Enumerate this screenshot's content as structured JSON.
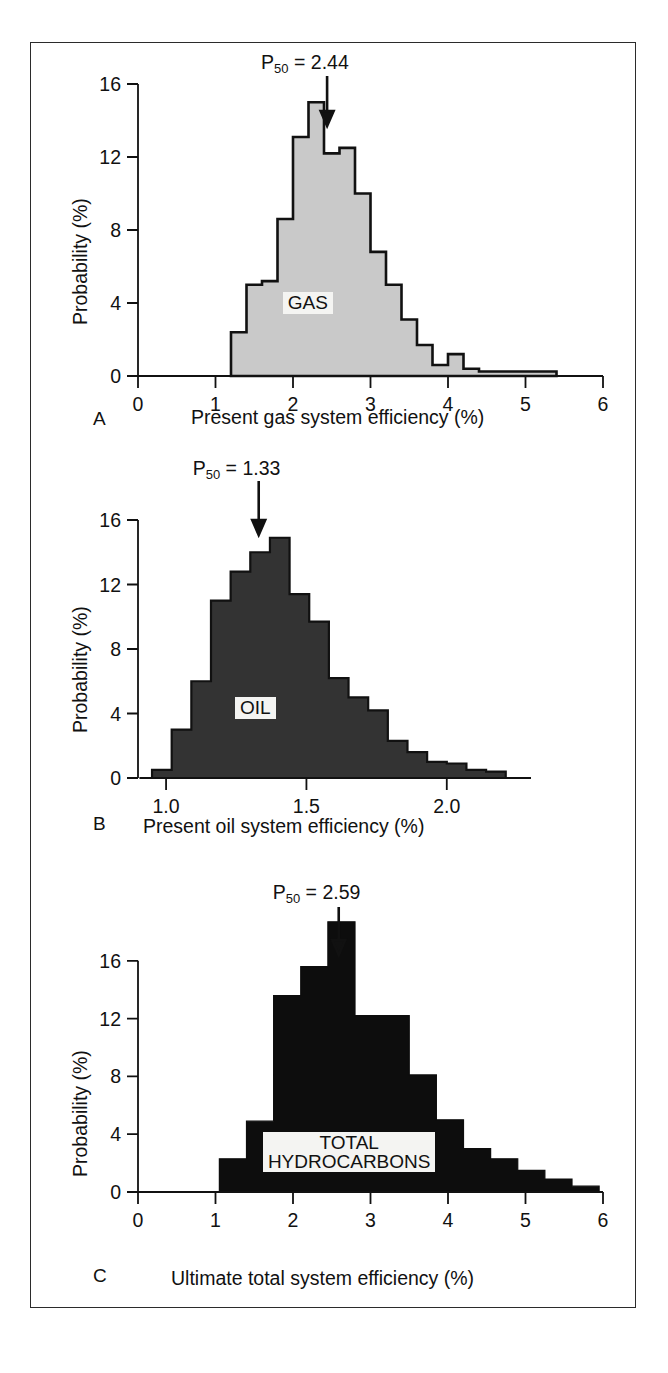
{
  "figure": {
    "background": "#ffffff",
    "frame_color": "#2b2b2b",
    "panels": [
      {
        "letter": "A",
        "tag": "GAS",
        "p50_prefix": "P",
        "p50_sub": "50",
        "p50_eq": " = 2.44",
        "xlabel": "Present gas system efficiency (%)",
        "ylabel": "Probability (%)"
      },
      {
        "letter": "B",
        "tag": "OIL",
        "p50_prefix": "P",
        "p50_sub": "50",
        "p50_eq": " = 1.33",
        "xlabel": "Present oil system efficiency (%)",
        "ylabel": "Probability (%)"
      },
      {
        "letter": "C",
        "tag_line1": "TOTAL",
        "tag_line2": "HYDROCARBONS",
        "p50_prefix": "P",
        "p50_sub": "50",
        "p50_eq": " = 2.59",
        "xlabel": "Ultimate total system efficiency (%)",
        "ylabel": "Probability (%)"
      }
    ]
  },
  "chart_data": [
    {
      "type": "bar",
      "panel": "A",
      "title": "GAS",
      "annotation": "P50 = 2.44",
      "p50": 2.44,
      "xlabel": "Present gas system efficiency (%)",
      "ylabel": "Probability (%)",
      "xlim": [
        0,
        6
      ],
      "ylim": [
        0,
        16
      ],
      "xticks": [
        0,
        1,
        2,
        3,
        4,
        5,
        6
      ],
      "xtick_labels": [
        "0",
        "1",
        "2",
        "3",
        "4",
        "5",
        "6"
      ],
      "yticks": [
        0,
        4,
        8,
        12,
        16
      ],
      "ytick_labels": [
        "0",
        "4",
        "8",
        "12",
        "16"
      ],
      "grid": false,
      "fill_color": "#c9c9c9",
      "edge_color": "#111111",
      "bin_width": 0.2,
      "bin_starts": [
        1.2,
        1.4,
        1.6,
        1.8,
        2.0,
        2.2,
        2.4,
        2.6,
        2.8,
        3.0,
        3.2,
        3.4,
        3.6,
        3.8,
        4.0,
        4.2,
        4.4,
        4.6,
        4.8,
        5.0,
        5.2
      ],
      "values": [
        2.4,
        5.0,
        5.2,
        8.6,
        13.1,
        15.0,
        12.2,
        12.5,
        10.0,
        6.8,
        5.0,
        3.1,
        1.7,
        0.6,
        1.2,
        0.4,
        0.25,
        0.25,
        0.25,
        0.25,
        0.25
      ]
    },
    {
      "type": "bar",
      "panel": "B",
      "title": "OIL",
      "annotation": "P50 = 1.33",
      "p50": 1.33,
      "xlabel": "Present oil system efficiency (%)",
      "ylabel": "Probability (%)",
      "xlim": [
        0.9,
        2.3
      ],
      "ylim": [
        0,
        16
      ],
      "xticks": [
        1.0,
        1.5,
        2.0
      ],
      "xtick_labels": [
        "1.0",
        "1.5",
        "2.0"
      ],
      "yticks": [
        0,
        4,
        8,
        12,
        16
      ],
      "ytick_labels": [
        "0",
        "4",
        "8",
        "12",
        "16"
      ],
      "grid": false,
      "fill_color": "#333333",
      "edge_color": "#111111",
      "bin_width": 0.07,
      "bin_starts": [
        0.95,
        1.02,
        1.09,
        1.16,
        1.23,
        1.3,
        1.37,
        1.44,
        1.51,
        1.58,
        1.65,
        1.72,
        1.79,
        1.86,
        1.93,
        2.0,
        2.07,
        2.14
      ],
      "values": [
        0.5,
        3.0,
        6.0,
        11.0,
        12.8,
        14.0,
        14.9,
        11.4,
        9.7,
        6.2,
        5.0,
        4.2,
        2.3,
        1.6,
        1.0,
        0.9,
        0.5,
        0.4
      ]
    },
    {
      "type": "bar",
      "panel": "C",
      "title": "TOTAL HYDROCARBONS",
      "annotation": "P50 = 2.59",
      "p50": 2.59,
      "xlabel": "Ultimate total system efficiency (%)",
      "ylabel": "Probability (%)",
      "xlim": [
        0,
        6
      ],
      "ylim": [
        0,
        20
      ],
      "xticks": [
        0,
        1,
        2,
        3,
        4,
        5,
        6
      ],
      "xtick_labels": [
        "0",
        "1",
        "2",
        "3",
        "4",
        "5",
        "6"
      ],
      "yticks": [
        0,
        4,
        8,
        12,
        16
      ],
      "ytick_labels": [
        "0",
        "4",
        "8",
        "12",
        "16"
      ],
      "grid": false,
      "fill_color": "#0d0d0d",
      "edge_color": "#0d0d0d",
      "bin_width": 0.35,
      "bin_starts": [
        1.05,
        1.4,
        1.75,
        2.1,
        2.45,
        2.8,
        3.15,
        3.5,
        3.85,
        4.2,
        4.55,
        4.9,
        5.25,
        5.6
      ],
      "values": [
        2.3,
        4.9,
        13.6,
        15.6,
        18.7,
        12.2,
        12.2,
        8.1,
        5.0,
        3.0,
        2.3,
        1.5,
        0.9,
        0.4
      ]
    }
  ]
}
